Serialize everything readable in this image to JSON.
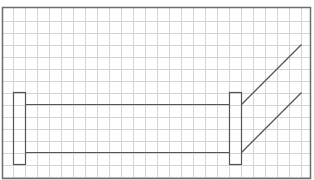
{
  "diagram": {
    "type": "grid-sketch",
    "colors": {
      "background": "#ffffff",
      "grid_line": "#d4d4d4",
      "border": "#6e6e6e",
      "shape_stroke": "#555555"
    },
    "grid": {
      "columns": 26,
      "rows": 14
    },
    "elements": [
      {
        "id": "left-flange",
        "kind": "rectangle",
        "cells": {
          "col": 1,
          "row": 7,
          "w": 1,
          "h": 6
        }
      },
      {
        "id": "right-flange",
        "kind": "rectangle",
        "cells": {
          "col": 19,
          "row": 7,
          "w": 1,
          "h": 6
        }
      },
      {
        "id": "pipe-top-edge",
        "kind": "line",
        "cells": {
          "from": [
            2,
            8
          ],
          "to": [
            19,
            8
          ]
        }
      },
      {
        "id": "pipe-bottom-edge",
        "kind": "line",
        "cells": {
          "from": [
            2,
            12
          ],
          "to": [
            19,
            12
          ]
        }
      },
      {
        "id": "upper-diagonal",
        "kind": "line",
        "cells": {
          "from": [
            20,
            8
          ],
          "to": [
            25,
            3
          ]
        }
      },
      {
        "id": "lower-diagonal",
        "kind": "line",
        "cells": {
          "from": [
            20,
            12
          ],
          "to": [
            25,
            7
          ]
        }
      }
    ]
  }
}
